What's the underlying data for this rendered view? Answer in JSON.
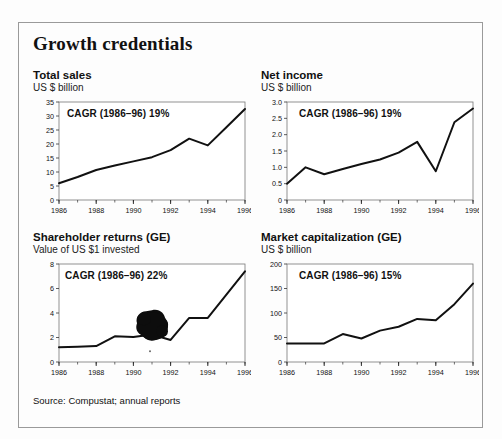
{
  "figure": {
    "title": "Growth credentials",
    "source": "Source: Compustat; annual reports"
  },
  "chart_data": [
    {
      "type": "line",
      "title": "Total sales",
      "subtitle": "US $ billion",
      "ylabel": "US $ billion",
      "xlabel": "",
      "annotation": "CAGR (1986–96) 19%",
      "cagr_period": "1986–96",
      "cagr_value": "19%",
      "x": [
        1986,
        1987,
        1988,
        1989,
        1990,
        1991,
        1992,
        1993,
        1994,
        1995,
        1996
      ],
      "values": [
        6.0,
        8.2,
        10.7,
        12.3,
        13.8,
        15.3,
        17.8,
        21.9,
        19.5,
        26.0,
        32.5
      ],
      "xticks": [
        1986,
        1988,
        1990,
        1992,
        1994,
        1996
      ],
      "yticks": [
        0,
        5,
        10,
        15,
        20,
        25,
        30,
        35
      ],
      "xlim": [
        1986,
        1996
      ],
      "ylim": [
        0,
        35
      ],
      "grid": false,
      "legend": false
    },
    {
      "type": "line",
      "title": "Net income",
      "subtitle": "US $ billion",
      "ylabel": "US $ billion",
      "xlabel": "",
      "annotation": "CAGR (1986–96) 19%",
      "cagr_period": "1986–96",
      "cagr_value": "19%",
      "x": [
        1986,
        1987,
        1988,
        1989,
        1990,
        1991,
        1992,
        1993,
        1994,
        1995,
        1996
      ],
      "values": [
        0.5,
        1.0,
        0.79,
        0.95,
        1.1,
        1.24,
        1.45,
        1.78,
        0.88,
        2.38,
        2.8
      ],
      "xticks": [
        1986,
        1988,
        1990,
        1992,
        1994,
        1996
      ],
      "yticks": [
        "0",
        "0.5",
        "1.0",
        "1.5",
        "2.0",
        "2.5",
        "3.0"
      ],
      "ytickvals": [
        0,
        0.5,
        1.0,
        1.5,
        2.0,
        2.5,
        3.0
      ],
      "xlim": [
        1986,
        1996
      ],
      "ylim": [
        0,
        3.0
      ],
      "grid": false,
      "legend": false
    },
    {
      "type": "line",
      "title": "Shareholder returns (GE)",
      "subtitle": "Value of US $1 invested",
      "ylabel": "Value of US $1 invested",
      "xlabel": "",
      "annotation": "CAGR (1986–96) 22%",
      "cagr_period": "1986–96",
      "cagr_value": "22%",
      "x": [
        1986,
        1987,
        1988,
        1989,
        1990,
        1991,
        1992,
        1993,
        1994,
        1995,
        1996
      ],
      "values": [
        1.2,
        1.25,
        1.3,
        2.1,
        2.05,
        2.25,
        1.8,
        3.6,
        3.6,
        5.5,
        7.4
      ],
      "xticks": [
        1986,
        1988,
        1990,
        1992,
        1994,
        1996
      ],
      "yticks": [
        0,
        2,
        4,
        6,
        8
      ],
      "xlim": [
        1986,
        1996
      ],
      "ylim": [
        0,
        8
      ],
      "grid": false,
      "legend": false,
      "artifact": "ink-blot obscuring 1991 data region"
    },
    {
      "type": "line",
      "title": "Market capitalization (GE)",
      "subtitle": "US $ billion",
      "ylabel": "US $ billion",
      "xlabel": "",
      "annotation": "CAGR (1986–96) 15%",
      "cagr_period": "1986–96",
      "cagr_value": "15%",
      "x": [
        1986,
        1987,
        1988,
        1989,
        1990,
        1991,
        1992,
        1993,
        1994,
        1995,
        1996
      ],
      "values": [
        38,
        38,
        38,
        57,
        48,
        64,
        72,
        88,
        85,
        118,
        160
      ],
      "xticks": [
        1986,
        1988,
        1990,
        1992,
        1994,
        1996
      ],
      "yticks": [
        0,
        50,
        100,
        150,
        200
      ],
      "xlim": [
        1986,
        1996
      ],
      "ylim": [
        0,
        200
      ],
      "grid": false,
      "legend": false
    }
  ]
}
